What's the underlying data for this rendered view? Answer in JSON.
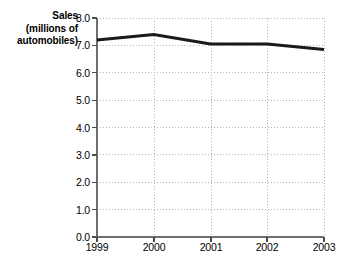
{
  "chart_data": {
    "type": "line",
    "title": "",
    "ylabel": "Sales (millions of automobiles)",
    "ylabel_lines": [
      "Sales",
      "(millions of",
      "automobiles)"
    ],
    "xlabel": "",
    "categories": [
      "1999",
      "2000",
      "2001",
      "2002",
      "2003"
    ],
    "values": [
      7.2,
      7.4,
      7.05,
      7.05,
      6.85
    ],
    "series": [
      {
        "name": "Sales",
        "values": [
          7.2,
          7.4,
          7.05,
          7.05,
          6.85
        ],
        "color": "#1a1a1a"
      }
    ],
    "ylim": [
      0.0,
      8.0
    ],
    "ytick_values": [
      0.0,
      1.0,
      2.0,
      3.0,
      4.0,
      5.0,
      6.0,
      7.0,
      8.0
    ],
    "ytick_labels": [
      "0.0",
      "1.0",
      "2.0",
      "3.0",
      "4.0",
      "5.0",
      "6.0",
      "7.0",
      "8.0"
    ],
    "xtick_labels": [
      "1999",
      "2000",
      "2001",
      "2002",
      "2003"
    ],
    "grid": true,
    "grid_style": "dotted",
    "grid_color": "#b4b4b4",
    "axis_color": "#6e6e6e",
    "legend": "none",
    "legend_position": "none",
    "background_color": "#ffffff",
    "line_color": "#1a1a1a",
    "line_width": 3
  }
}
